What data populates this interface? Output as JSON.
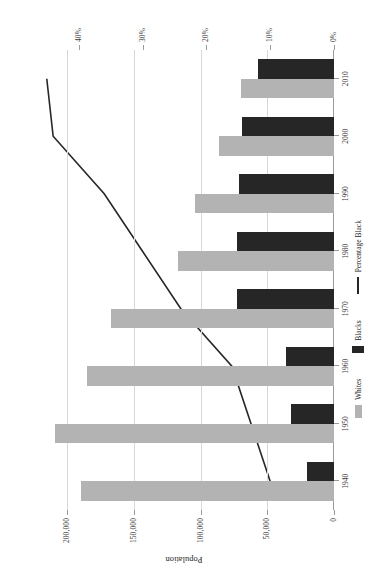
{
  "chart_data": {
    "type": "bar",
    "title": "",
    "orientation": "rotated-90-ccw",
    "categories": [
      "1940",
      "1950",
      "1960",
      "1970",
      "1980",
      "1990",
      "2000",
      "2010"
    ],
    "xlabel": "",
    "ylabel": "Population",
    "y2label": "Percentage black",
    "ylim": [
      0,
      225000
    ],
    "y2lim": [
      0,
      47
    ],
    "grid": true,
    "legend_position": "bottom-right",
    "series": [
      {
        "name": "Whites",
        "type": "bar",
        "axis": "left",
        "color": "#b3b3b3",
        "values": [
          190000,
          209000,
          185000,
          167000,
          117000,
          104000,
          86000,
          70000
        ]
      },
      {
        "name": "Blacks",
        "type": "bar",
        "axis": "left",
        "color": "#262626",
        "values": [
          20000,
          32000,
          36000,
          73000,
          73000,
          71000,
          69000,
          57000
        ]
      },
      {
        "name": "Percentage Black",
        "type": "line",
        "axis": "right",
        "color": "#262626",
        "values": [
          10,
          13,
          16,
          24,
          30,
          36,
          44,
          45
        ]
      }
    ],
    "population_ticks": [
      "0",
      "50,000",
      "100,000",
      "150,000",
      "200,000"
    ],
    "population_tick_values": [
      0,
      50000,
      100000,
      150000,
      200000
    ],
    "percentage_ticks": [
      "0%",
      "10%",
      "20%",
      "30%",
      "40%"
    ],
    "percentage_tick_values": [
      0,
      10,
      20,
      30,
      40
    ]
  },
  "axes": {
    "population_title": "Population",
    "percentage_title": "Percentage black"
  },
  "legend": {
    "whites_label": "Whites",
    "blacks_label": "Blacks",
    "percentage_label": "Percentage Black"
  }
}
